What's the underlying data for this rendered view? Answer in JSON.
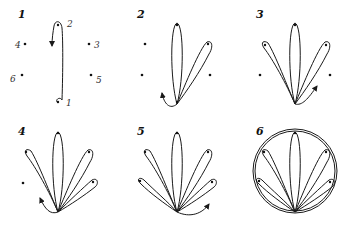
{
  "figure": {
    "stroke_color": "#1a1a1a",
    "background": "#ffffff"
  },
  "panels": [
    {
      "step": "1",
      "point_labels": [
        "1",
        "2",
        "3",
        "4",
        "5",
        "6"
      ]
    },
    {
      "step": "2"
    },
    {
      "step": "3"
    },
    {
      "step": "4"
    },
    {
      "step": "5"
    },
    {
      "step": "6"
    }
  ]
}
